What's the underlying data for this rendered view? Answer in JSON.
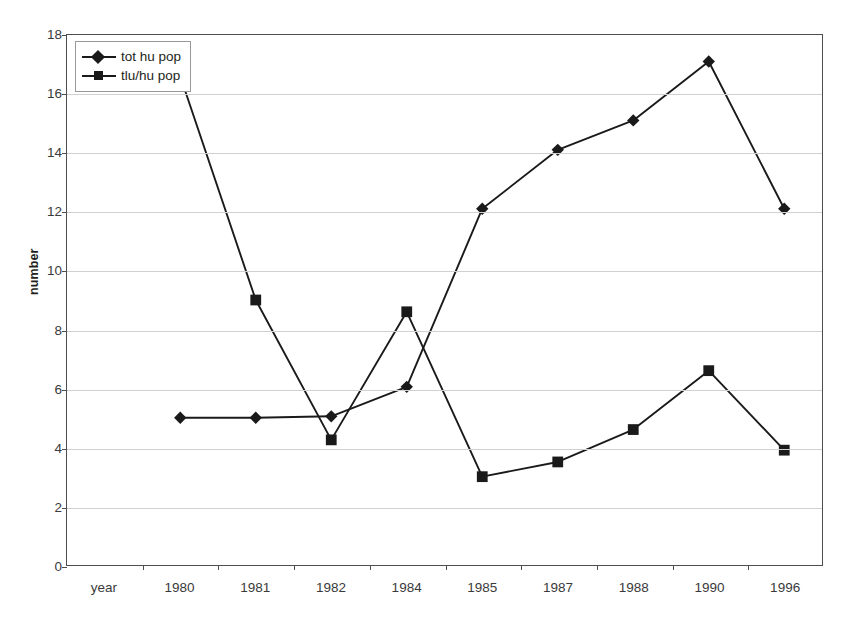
{
  "chart_data": {
    "type": "line",
    "title": "",
    "xlabel": "year",
    "ylabel": "number",
    "categories": [
      "1980",
      "1981",
      "1982",
      "1984",
      "1985",
      "1987",
      "1988",
      "1990",
      "1996"
    ],
    "series": [
      {
        "name": "tot hu pop",
        "marker": "diamond",
        "color": "#1a1a1a",
        "values": [
          5.0,
          5.0,
          5.05,
          6.05,
          12.1,
          14.1,
          15.1,
          17.1,
          12.1
        ]
      },
      {
        "name": "tlu/hu pop",
        "marker": "square",
        "color": "#1a1a1a",
        "values": [
          16.6,
          9.0,
          4.25,
          8.6,
          3.0,
          3.5,
          4.6,
          6.6,
          3.9
        ]
      }
    ],
    "ylim": [
      0,
      18
    ],
    "yticks": [
      0,
      2,
      4,
      6,
      8,
      10,
      12,
      14,
      16,
      18
    ],
    "ytick_labels": [
      "0",
      "2",
      "4",
      "6",
      "8",
      "10",
      "12",
      "14",
      "16",
      "18"
    ],
    "grid": "horizontal",
    "legend_position": "top-left",
    "legend_entries": [
      "tot hu pop",
      "tlu/hu pop"
    ]
  },
  "axes": {
    "y_axis_title": "number",
    "x_axis_title": "year"
  }
}
